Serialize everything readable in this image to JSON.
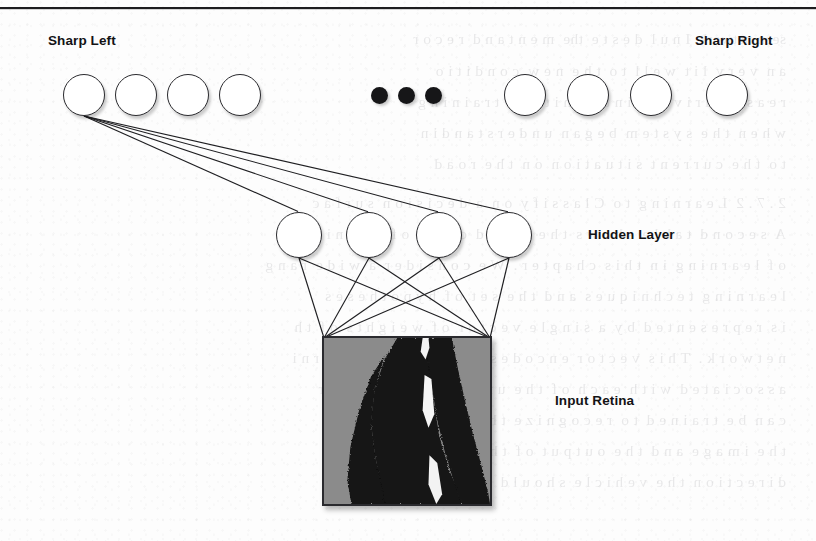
{
  "figure": {
    "title_visible": false,
    "labels": {
      "sharp_left": "Sharp Left",
      "sharp_right": "Sharp Right",
      "hidden_layer": "Hidden Layer",
      "input_retina": "Input Retina"
    },
    "colors": {
      "node_fill": "#ffffff",
      "node_stroke": "#2a2a2e",
      "wire": "#1f1f22",
      "ellipsis_dot": "#161618",
      "retina_background": "#8b8b8b",
      "retina_road": "#111111",
      "retina_lane_marking": "#f2f2f2",
      "text": "#131315",
      "rule": "#1d1d1f",
      "page": "#fdfdfd"
    },
    "output_layer": {
      "name": "output-layer",
      "visible_unit_count": 8,
      "ellipsis": "•••",
      "units": [
        {
          "id": "out-1",
          "cx": 84,
          "cy": 95,
          "r": 21
        },
        {
          "id": "out-2",
          "cx": 136,
          "cy": 95,
          "r": 21
        },
        {
          "id": "out-3",
          "cx": 188,
          "cy": 95,
          "r": 21
        },
        {
          "id": "out-4",
          "cx": 240,
          "cy": 95,
          "r": 21
        },
        {
          "id": "out-5",
          "cx": 525,
          "cy": 95,
          "r": 21
        },
        {
          "id": "out-6",
          "cx": 588,
          "cy": 95,
          "r": 21
        },
        {
          "id": "out-7",
          "cx": 651,
          "cy": 95,
          "r": 21
        },
        {
          "id": "out-8",
          "cx": 727,
          "cy": 95,
          "r": 21
        }
      ],
      "ellipsis_dots": [
        {
          "cx": 379,
          "cy": 95,
          "r": 8.5
        },
        {
          "cx": 406,
          "cy": 95,
          "r": 8.5
        },
        {
          "cx": 433,
          "cy": 95,
          "r": 8.5
        }
      ]
    },
    "hidden_layer": {
      "name": "hidden-layer",
      "unit_count": 4,
      "units": [
        {
          "id": "hid-1",
          "cx": 299,
          "cy": 235,
          "r": 23
        },
        {
          "id": "hid-2",
          "cx": 369,
          "cy": 235,
          "r": 23
        },
        {
          "id": "hid-3",
          "cx": 439,
          "cy": 235,
          "r": 23
        },
        {
          "id": "hid-4",
          "cx": 509,
          "cy": 235,
          "r": 23
        }
      ]
    },
    "input_retina_box": {
      "name": "input-retina",
      "x": 322,
      "y": 336,
      "width": 170,
      "height": 170,
      "fan_in_points": [
        {
          "x": 324,
          "y": 338
        },
        {
          "x": 490,
          "y": 338
        }
      ]
    },
    "connections": {
      "output_to_hidden_source": {
        "cx": 84,
        "cy": 116
      },
      "output_to_hidden_count": 4,
      "hidden_to_retina_count": 8
    },
    "label_positions": {
      "sharp_left": {
        "x": 48,
        "y": 33
      },
      "sharp_right": {
        "x": 695,
        "y": 33
      },
      "hidden_layer": {
        "x": 588,
        "y": 227
      },
      "input_retina": {
        "x": 555,
        "y": 393
      }
    }
  },
  "bleed_through_lines": [
    {
      "top": 30,
      "text": "seen network  I n u l  d e s t e  the  m e n t a n d  r e c o r"
    },
    {
      "top": 62,
      "text": "a n  v e r y  l i t  w e l l  t o  t h e  n e w  c o n d i t i o"
    },
    {
      "top": 93,
      "text": "r e a s o n  d r i v i n g  i n t e r  m i t  e n t  t r a i n i n g"
    },
    {
      "top": 124,
      "text": "w h e n  t h e  s y s t e m  b e g a n  u n d e r s t a n d i n"
    },
    {
      "top": 155,
      "text": "t o  t h e  c u r r e n t  s i t u a t i o n  o n  t h e  r o a d"
    },
    {
      "top": 194,
      "text": "2 . 7 . 2  L e a r n i n g  t o  C l a s s i f y  o n  a  d e c i s i o n  s u r f a c"
    },
    {
      "top": 225,
      "text": "A  s e c o n d  t a b l e  s h o w s  t h e  b r o a d  c l a s s  o f  t r a i n i n g"
    },
    {
      "top": 256,
      "text": "o f  l e a r n i n g  i n  t h i s  c h a p t e r .  W e  c o n s i d e r  a  w i d e  r a n g"
    },
    {
      "top": 287,
      "text": "l e a r n i n g  t e c h n i q u e s  a n d  t h e  s e t  o f  h y p o t h e s e s"
    },
    {
      "top": 318,
      "text": "i s  r e p r e s e n t e d  b y  a  s i n g l e  v e c t o r  o f  w e i g h t s  o f  t h"
    },
    {
      "top": 349,
      "text": "n e t w o r k .  T h i s  v e c t o r  e n c o d e s  t h e  r e s u l t  o f  l e a r n i"
    },
    {
      "top": 380,
      "text": "a s s o c i a t e d  w i t h  e a c h  o f  t h e  u n i t s  i n  t h e  n e t w o r"
    },
    {
      "top": 411,
      "text": "c a n  b e  t r a i n e d  t o  r e c o g n i z e  t h e  m a n y  f e a t u r e s"
    },
    {
      "top": 442,
      "text": "t h e  i m a g e  a n d  t h e  o u t p u t  o f  t h e  c l a s s i f i e r  t h e"
    },
    {
      "top": 473,
      "text": "d i r e c t i o n  t h e  v e h i c l e  s h o u l d  s t e e r  t o  s t a y  o n  t"
    }
  ]
}
